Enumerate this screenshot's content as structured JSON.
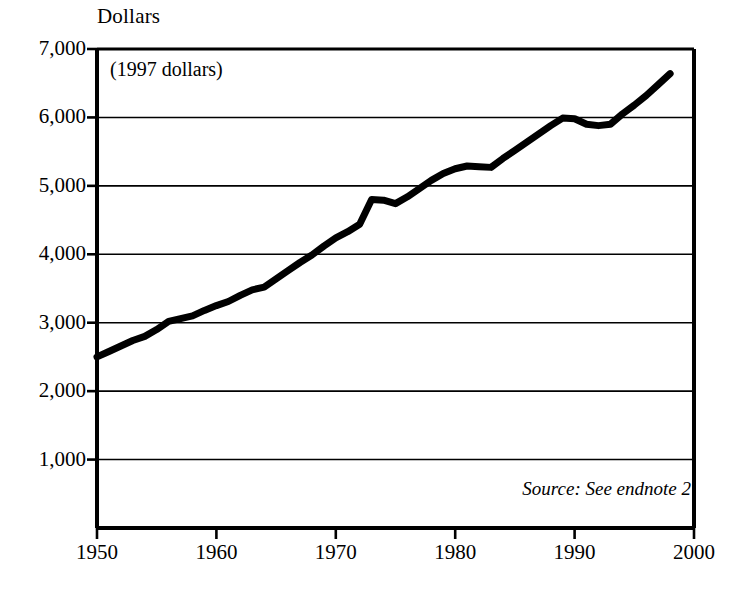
{
  "chart_data": {
    "type": "line",
    "title": "Dollars",
    "xlabel": "",
    "ylabel": "Dollars",
    "annotations": [
      "(1997 dollars)"
    ],
    "source_note": "Source: See endnote 2",
    "grid": true,
    "legend": "none",
    "xlim": [
      1950,
      2000
    ],
    "ylim": [
      0,
      7000
    ],
    "xticks": [
      "1950",
      "1960",
      "1970",
      "1980",
      "1990",
      "2000"
    ],
    "yticks": [
      "1,000",
      "2,000",
      "3,000",
      "4,000",
      "5,000",
      "6,000",
      "7,000"
    ],
    "ytick_values": [
      1000,
      2000,
      3000,
      4000,
      5000,
      6000,
      7000
    ],
    "xtick_values": [
      1950,
      1960,
      1970,
      1980,
      1990,
      2000
    ],
    "line_color": "#000000",
    "line_width": 7,
    "x": [
      1950,
      1951,
      1952,
      1953,
      1954,
      1955,
      1956,
      1957,
      1958,
      1959,
      1960,
      1961,
      1962,
      1963,
      1964,
      1965,
      1966,
      1967,
      1968,
      1969,
      1970,
      1971,
      1972,
      1973,
      1974,
      1975,
      1976,
      1977,
      1978,
      1979,
      1980,
      1981,
      1982,
      1983,
      1984,
      1985,
      1986,
      1987,
      1988,
      1989,
      1990,
      1991,
      1992,
      1993,
      1994,
      1995,
      1996,
      1997,
      1998
    ],
    "values": [
      2500,
      2580,
      2660,
      2740,
      2800,
      2900,
      3020,
      3060,
      3100,
      3180,
      3250,
      3310,
      3400,
      3480,
      3520,
      3640,
      3760,
      3880,
      3990,
      4120,
      4240,
      4330,
      4440,
      4800,
      4790,
      4740,
      4840,
      4960,
      5080,
      5180,
      5250,
      5290,
      5280,
      5270,
      5400,
      5520,
      5640,
      5760,
      5880,
      5990,
      5980,
      5900,
      5880,
      5900,
      6050,
      6180,
      6320,
      6480,
      6640
    ],
    "series_name": "Real dollars per capita"
  },
  "labels": {
    "axis_title": "Dollars",
    "inplot_note": "(1997 dollars)",
    "source": "Source: See endnote 2"
  }
}
